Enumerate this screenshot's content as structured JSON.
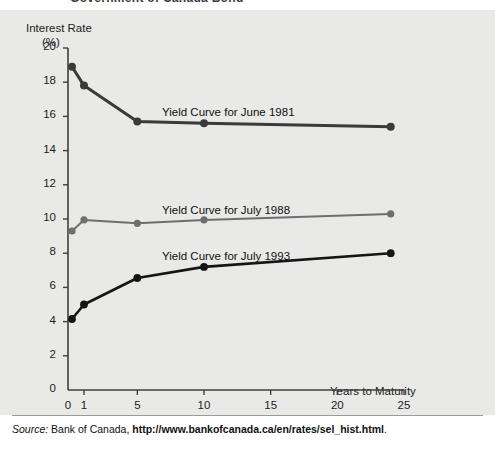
{
  "figure": {
    "clipped_title": "Government of Canada Bond",
    "source_prefix": "Source:",
    "source_org": "Bank of Canada,",
    "source_url": "http://www.bankofcanada.ca/en/rates/sel_hist.html",
    "source_suffix": "."
  },
  "colors": {
    "panel_bg": "#e9e9e7",
    "page_bg": "#ffffff",
    "axis": "#3f3f3f",
    "series_1981": "#3a3a3a",
    "series_1988": "#6e6e6e",
    "series_1993": "#151515",
    "text": "#1d1d1d",
    "rule": "#9a9a96"
  },
  "chart_data": {
    "type": "line",
    "title": "Government of Canada Bond",
    "xlabel": "Years to Maturity",
    "ylabel": "Interest Rate",
    "ylabel_unit": "(%)",
    "ylim": [
      0,
      20
    ],
    "yticks": [
      0,
      2,
      4,
      6,
      8,
      10,
      12,
      14,
      16,
      18,
      20
    ],
    "xticks": [
      0,
      1,
      5,
      10,
      15,
      20,
      25
    ],
    "x_scale_note": "piecewise: 0-1 compressed, 1-25 linear",
    "grid": false,
    "legend": "inline-labels",
    "x": [
      0.25,
      1,
      5,
      10,
      24
    ],
    "series": [
      {
        "name": "Yield Curve for June 1981",
        "label": "Yield Curve for June 1981",
        "color": "#3a3a3a",
        "values": [
          18.9,
          17.8,
          15.7,
          15.6,
          15.4
        ]
      },
      {
        "name": "Yield Curve for July 1988",
        "label": "Yield Curve for July 1988",
        "color": "#6e6e6e",
        "values": [
          9.3,
          9.95,
          9.75,
          9.95,
          10.3
        ]
      },
      {
        "name": "Yield Curve for July 1993",
        "label": "Yield Curve for July 1993",
        "color": "#151515",
        "values": [
          4.15,
          5.0,
          6.55,
          7.2,
          8.0
        ]
      }
    ],
    "label_positions": [
      {
        "series": "Yield Curve for June 1981",
        "x": 162,
        "y": 96
      },
      {
        "series": "Yield Curve for July 1988",
        "x": 162,
        "y": 194
      },
      {
        "series": "Yield Curve for July 1993",
        "x": 162,
        "y": 240
      }
    ]
  }
}
